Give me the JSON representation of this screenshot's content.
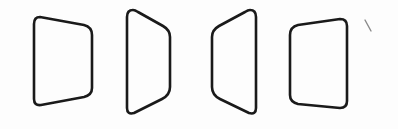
{
  "figure": {
    "title": "Four rounded trapezoids in perspective (panel rotating)",
    "stroke_color": "#1a1a1a",
    "background_color": "#fdfdfd",
    "mark_color": "#8a8a8a"
  },
  "shapes": [
    {
      "id": "trapezoid-1",
      "description": "Panel facing slightly right; left edge taller than right edge"
    },
    {
      "id": "trapezoid-2",
      "description": "Panel turned strongly right; tall left edge, short right edge"
    },
    {
      "id": "trapezoid-3",
      "description": "Panel turned strongly left; short left edge, tall right edge"
    },
    {
      "id": "trapezoid-4",
      "description": "Panel facing slightly left; left edge nearly as tall as right edge"
    }
  ],
  "annotations": [
    {
      "id": "stray-mark",
      "description": "Small diagonal pencil stroke near top-right"
    }
  ]
}
